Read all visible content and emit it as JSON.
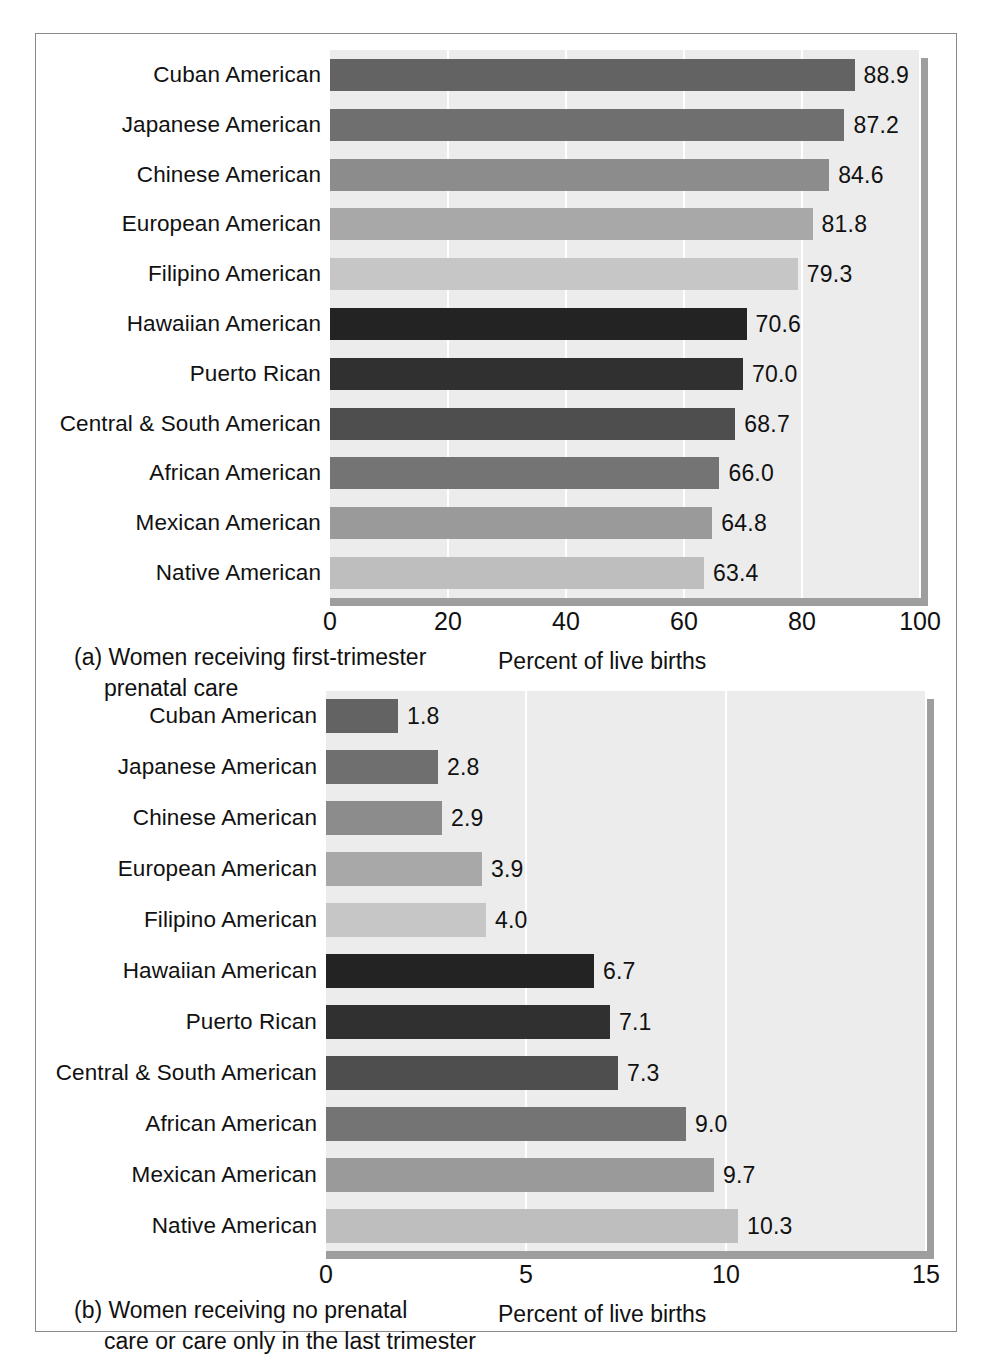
{
  "figure": {
    "frame_border_color": "#8a8a8a",
    "background_color": "#ffffff",
    "plot_field_color": "#ececec",
    "shadow_color": "#9e9e9e",
    "gridline_color": "#ffffff"
  },
  "chart_data": [
    {
      "id": "panel-a",
      "type": "bar",
      "orientation": "horizontal",
      "title": "",
      "caption_line1": "(a) Women receiving first-trimester",
      "caption_line2": "prenatal care",
      "xlabel": "Percent of live births",
      "ylabel": "",
      "xlim": [
        0,
        100
      ],
      "xticks": [
        0,
        20,
        40,
        60,
        80,
        100
      ],
      "xtick_labels": [
        "0",
        "20",
        "40",
        "60",
        "80",
        "100"
      ],
      "grid": true,
      "legend": "none",
      "categories": [
        "Cuban American",
        "Japanese American",
        "Chinese American",
        "European American",
        "Filipino American",
        "Hawaiian American",
        "Puerto Rican",
        "Central & South American",
        "African American",
        "Mexican American",
        "Native American"
      ],
      "values": [
        88.9,
        87.2,
        84.6,
        81.8,
        79.3,
        70.6,
        70.0,
        68.7,
        66.0,
        64.8,
        63.4
      ],
      "value_labels": [
        "88.9",
        "87.2",
        "84.6",
        "81.8",
        "79.3",
        "70.6",
        "70.0",
        "68.7",
        "66.0",
        "64.8",
        "63.4"
      ],
      "bar_colors": [
        "#636363",
        "#6f6f6f",
        "#8c8c8c",
        "#a8a8a8",
        "#c6c6c6",
        "#232323",
        "#303030",
        "#4e4e4e",
        "#747474",
        "#9a9a9a",
        "#bebebe"
      ]
    },
    {
      "id": "panel-b",
      "type": "bar",
      "orientation": "horizontal",
      "title": "",
      "caption_line1": "(b) Women receiving no prenatal",
      "caption_line2": "care or care only in the last trimester",
      "xlabel": "Percent of live births",
      "ylabel": "",
      "xlim": [
        0,
        15
      ],
      "xticks": [
        0,
        5,
        10,
        15
      ],
      "xtick_labels": [
        "0",
        "5",
        "10",
        "15"
      ],
      "grid": true,
      "legend": "none",
      "categories": [
        "Cuban American",
        "Japanese American",
        "Chinese American",
        "European American",
        "Filipino American",
        "Hawaiian American",
        "Puerto Rican",
        "Central & South American",
        "African American",
        "Mexican American",
        "Native American"
      ],
      "values": [
        1.8,
        2.8,
        2.9,
        3.9,
        4.0,
        6.7,
        7.1,
        7.3,
        9.0,
        9.7,
        10.3
      ],
      "value_labels": [
        "1.8",
        "2.8",
        "2.9",
        "3.9",
        "4.0",
        "6.7",
        "7.1",
        "7.3",
        "9.0",
        "9.7",
        "10.3"
      ],
      "bar_colors": [
        "#636363",
        "#6f6f6f",
        "#8c8c8c",
        "#a8a8a8",
        "#c6c6c6",
        "#232323",
        "#303030",
        "#4e4e4e",
        "#747474",
        "#9a9a9a",
        "#bebebe"
      ]
    }
  ]
}
